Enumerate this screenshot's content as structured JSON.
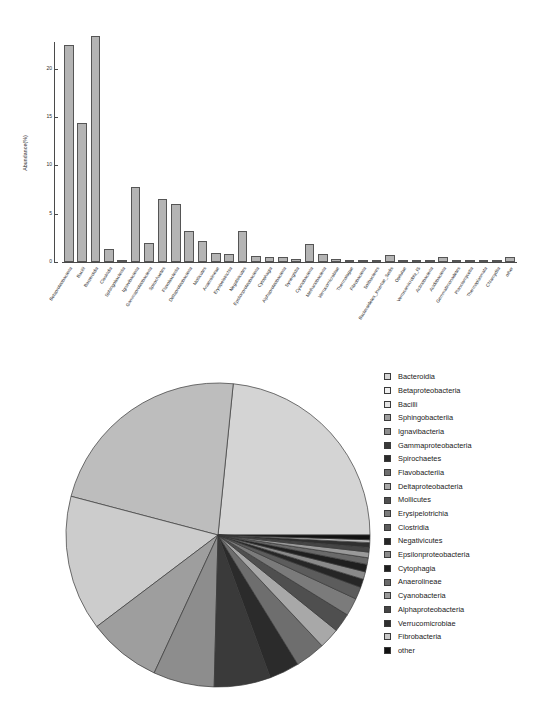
{
  "figure": {
    "panels": [
      "bar-chart",
      "pie-chart"
    ]
  },
  "bar_panel": {
    "ylabel": "Abundance(%)",
    "y_ticks": [
      "0",
      "5",
      "10",
      "15",
      "20"
    ]
  },
  "pie_panel": {
    "legend_title": ""
  },
  "chart_data": [
    {
      "type": "bar",
      "title": "",
      "xlabel": "",
      "ylabel": "Abundance(%)",
      "ylim": [
        0,
        24
      ],
      "yticks": [
        0,
        5,
        10,
        15,
        20
      ],
      "grid": false,
      "categories": [
        "Betaproteobacteria",
        "Bacilli",
        "Bacteroidia",
        "Clostridia",
        "Sphingobacteriia",
        "Ignavibacteria",
        "Gammaproteobacteria",
        "Spirochaetes",
        "Flavobacteriia",
        "Deltaproteobacteria",
        "Mollicutes",
        "Anaerolineae",
        "Erysipelotrichia",
        "Negativicutes",
        "Epsilonproteobacteria",
        "Cytophagia",
        "Alphaproteobacteria",
        "Synergistia",
        "Cyanobacteria",
        "Methanobacteria",
        "Verrucomicrobiae",
        "Thermotogae",
        "Fibrobacteria",
        "Solibacteres",
        "Bacteroidetes_Incertae_Sedis",
        "Opitutae",
        "Verrucomicrobia_IS",
        "Actinobacteria",
        "Acidobacteria",
        "Gemmatimonadetes",
        "Planctomycetia",
        "Thermoplasmata",
        "Chlamydiia",
        "other"
      ],
      "values": [
        22.5,
        14.4,
        23.4,
        1.3,
        0.2,
        7.8,
        2.0,
        6.5,
        6.0,
        3.2,
        2.2,
        0.9,
        0.8,
        3.2,
        0.6,
        0.5,
        0.5,
        0.3,
        1.9,
        0.8,
        0.3,
        0.25,
        0.2,
        0.2,
        0.7,
        0.2,
        0.2,
        0.2,
        0.5,
        0.2,
        0.2,
        0.2,
        0.2,
        0.5
      ]
    },
    {
      "type": "pie",
      "title": "",
      "legend_position": "right",
      "start_angle": 0,
      "direction": "counterclockwise",
      "labels": [
        "Bacteroidia",
        "Betaproteobacteria",
        "Bacilli",
        "Sphingobacteriia",
        "Ignavibacteria",
        "Gammaproteobacteria",
        "Spirochaetes",
        "Flavobacteriia",
        "Deltaproteobacteria",
        "Mollicutes",
        "Erysipelotrichia",
        "Clostridia",
        "Negativicutes",
        "Epsilonproteobacteria",
        "Cytophagia",
        "Anaerolineae",
        "Cyanobacteria",
        "Alphaproteobacteria",
        "Verrucomicrobiae",
        "Fibrobacteria",
        "other"
      ],
      "values": [
        23.4,
        22.5,
        14.4,
        7.8,
        6.5,
        6.0,
        3.2,
        3.2,
        2.2,
        2.0,
        1.9,
        1.3,
        0.9,
        0.8,
        0.8,
        0.7,
        0.6,
        0.5,
        0.5,
        0.3,
        0.5
      ],
      "colors": [
        "#d4d4d4",
        "#bdbdbd",
        "#cccccc",
        "#9e9e9e",
        "#8d8d8d",
        "#3a3a3a",
        "#2b2b2b",
        "#6e6e6e",
        "#a8a8a8",
        "#4f4f4f",
        "#7b7b7b",
        "#5c5c5c",
        "#262626",
        "#8a8a8a",
        "#1f1f1f",
        "#6a6a6a",
        "#9a9a9a",
        "#454545",
        "#2f2f2f",
        "#b8b8b8",
        "#111111"
      ]
    }
  ],
  "legend": {
    "items": [
      {
        "label": "Bacteroidia",
        "color": "#d4d4d4"
      },
      {
        "label": "Betaproteobacteria",
        "color": "#f0f0f0"
      },
      {
        "label": "Bacilli",
        "color": "#e4e4e4"
      },
      {
        "label": "Sphingobacteriia",
        "color": "#9e9e9e"
      },
      {
        "label": "Ignavibacteria",
        "color": "#8d8d8d"
      },
      {
        "label": "Gammaproteobacteria",
        "color": "#3a3a3a"
      },
      {
        "label": "Spirochaetes",
        "color": "#2b2b2b"
      },
      {
        "label": "Flavobacteriia",
        "color": "#6e6e6e"
      },
      {
        "label": "Deltaproteobacteria",
        "color": "#a8a8a8"
      },
      {
        "label": "Mollicutes",
        "color": "#4f4f4f"
      },
      {
        "label": "Erysipelotrichia",
        "color": "#7b7b7b"
      },
      {
        "label": "Clostridia",
        "color": "#5c5c5c"
      },
      {
        "label": "Negativicutes",
        "color": "#262626"
      },
      {
        "label": "Epsilonproteobacteria",
        "color": "#8a8a8a"
      },
      {
        "label": "Cytophagia",
        "color": "#1f1f1f"
      },
      {
        "label": "Anaerolineae",
        "color": "#6a6a6a"
      },
      {
        "label": "Cyanobacteria",
        "color": "#9a9a9a"
      },
      {
        "label": "Alphaproteobacteria",
        "color": "#454545"
      },
      {
        "label": "Verrucomicrobiae",
        "color": "#2f2f2f"
      },
      {
        "label": "Fibrobacteria",
        "color": "#c8c8c8"
      },
      {
        "label": "other",
        "color": "#111111"
      }
    ]
  }
}
